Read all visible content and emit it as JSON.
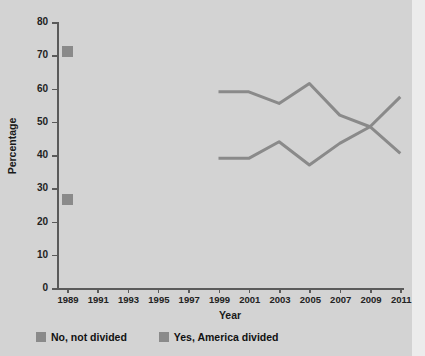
{
  "chart_data": {
    "type": "line",
    "title": "",
    "xlabel": "Year",
    "ylabel": "Percentage",
    "xlim": [
      1988,
      2012
    ],
    "ylim": [
      0,
      80
    ],
    "ytick_labels": [
      "0",
      "10",
      "20",
      "30",
      "40",
      "50",
      "60",
      "70",
      "80"
    ],
    "ytick_values": [
      0,
      10,
      20,
      30,
      40,
      50,
      60,
      70,
      80
    ],
    "xtick_labels": [
      "1989",
      "1991",
      "1993",
      "1995",
      "1997",
      "1999",
      "2001",
      "2003",
      "2005",
      "2007",
      "2009",
      "2011"
    ],
    "xtick_values": [
      1989,
      1991,
      1993,
      1995,
      1997,
      1999,
      2001,
      2003,
      2005,
      2007,
      2009,
      2011
    ],
    "grid": false,
    "legend_position": "bottom-left",
    "series": [
      {
        "name": "No, not divided",
        "color": "#8a8a8a",
        "marker_points": [
          {
            "x": 1989,
            "y": 71
          }
        ],
        "x": [
          1999,
          2001,
          2003,
          2005,
          2007,
          2009,
          2011
        ],
        "values": [
          59,
          59,
          55.5,
          61.5,
          52,
          48.5,
          57.5
        ]
      },
      {
        "name": "Yes, America divided",
        "color": "#8a8a8a",
        "marker_points": [
          {
            "x": 1989,
            "y": 26.5
          }
        ],
        "x": [
          1999,
          2001,
          2003,
          2005,
          2007,
          2009,
          2011
        ],
        "values": [
          39,
          39,
          44,
          37,
          43.5,
          48.5,
          40.5
        ]
      }
    ]
  },
  "axes": {
    "ylabel": "Percentage",
    "xlabel": "Year"
  },
  "legend": {
    "items": [
      {
        "label": "No, not divided",
        "color": "#8a8a8a"
      },
      {
        "label": "Yes, America divided",
        "color": "#8a8a8a"
      }
    ]
  },
  "colors": {
    "background": "#d3d3d3",
    "page_edge": "#ececec",
    "axis": "#5a5a5a",
    "series": "#8a8a8a",
    "text": "#1a1a1a"
  }
}
